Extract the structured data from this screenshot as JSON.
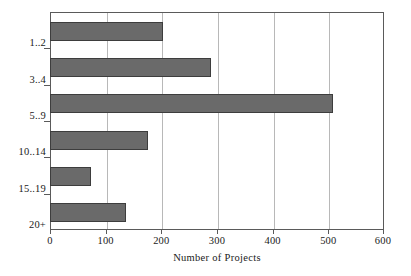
{
  "chart_data": {
    "type": "bar",
    "orientation": "horizontal",
    "title": "",
    "subtitle": "",
    "xlabel": "Number of Projects",
    "ylabel": "",
    "categories": [
      "1..2",
      "3..4",
      "5..9",
      "10..14",
      "15..19",
      "20+"
    ],
    "values": [
      203,
      290,
      510,
      175,
      73,
      135
    ],
    "series": [
      {
        "name": "Number of Projects",
        "values": [
          203,
          290,
          510,
          175,
          73,
          135
        ]
      }
    ],
    "xlim": [
      0,
      600
    ],
    "xticks": [
      0,
      100,
      200,
      300,
      400,
      500,
      600
    ],
    "xtick_labels": [
      "0",
      "100",
      "200",
      "300",
      "400",
      "500",
      "600"
    ],
    "grid": "vertical",
    "legend": "none",
    "bar_color": "#6a6a6a",
    "bar_border_color": "#3d3d3d",
    "gridline_color": "#b8b8b8",
    "frame_color": "#5a5a5a",
    "background_color": "#ffffff",
    "annotations": []
  },
  "axis": {
    "x_title": "Number of Projects"
  }
}
